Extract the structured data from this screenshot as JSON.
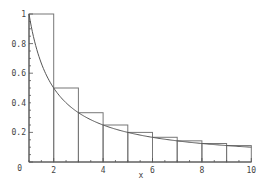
{
  "chart_data": {
    "type": "bar",
    "title": "",
    "xlabel": "x",
    "ylabel": "",
    "xlim": [
      1,
      10
    ],
    "ylim": [
      0,
      1
    ],
    "grid": false,
    "legend": null,
    "x_ticks": [
      "2",
      "4",
      "6",
      "8",
      "10"
    ],
    "y_ticks": [
      "0.2",
      "0.4",
      "0.6",
      "0.8",
      "1"
    ],
    "origin_label": "0",
    "bars": {
      "left_edges": [
        1,
        2,
        3,
        4,
        5,
        6,
        7,
        8,
        9
      ],
      "right_edges": [
        2,
        3,
        4,
        5,
        6,
        7,
        8,
        9,
        10
      ],
      "heights": [
        1.0,
        0.5,
        0.333,
        0.25,
        0.2,
        0.167,
        0.143,
        0.125,
        0.111
      ]
    },
    "series": [
      {
        "name": "1/x curve",
        "type": "line",
        "function": "1/x",
        "x_range": [
          1,
          10
        ]
      }
    ],
    "annotations": [
      "Left-endpoint rectangles under y = 1/x"
    ]
  },
  "colors": {
    "background": "#ffffff",
    "bars_stroke": "#777777",
    "curve": "#555555",
    "axis": "#555555",
    "labels": "#444444"
  }
}
